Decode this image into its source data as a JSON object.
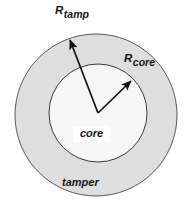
{
  "figure": {
    "background_color": "#ffffff"
  },
  "regions": {
    "tamper": {
      "label": "tamper",
      "fill_color": "#dedede",
      "stroke_color": "#5a5a5a",
      "center_x": 96,
      "center_y": 115,
      "radius": 81
    },
    "core": {
      "label": "core",
      "fill_color": "#f7f7f7",
      "stroke_color": "#3a3a3a",
      "center_x": 98,
      "center_y": 113,
      "radius": 49
    }
  },
  "arrows": {
    "origin_x": 98,
    "origin_y": 113,
    "color": "#111111",
    "items": [
      {
        "name": "R_tamp",
        "base": "R",
        "subscript": "tamp",
        "tip_x": 70,
        "tip_y": 40,
        "label_x": 55,
        "label_y": 5
      },
      {
        "name": "R_core",
        "base": "R",
        "subscript": "core",
        "tip_x": 131,
        "tip_y": 81,
        "label_x": 124,
        "label_y": 53
      }
    ]
  }
}
